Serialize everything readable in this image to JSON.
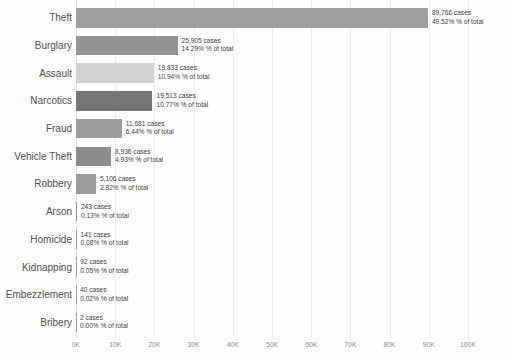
{
  "chart_data": {
    "type": "bar",
    "orientation": "horizontal",
    "title": "",
    "xlabel": "",
    "ylabel": "",
    "categories": [
      "Theft",
      "Burglary",
      "Assault",
      "Narcotics",
      "Fraud",
      "Vehicle Theft",
      "Robbery",
      "Arson",
      "Homicide",
      "Kidnapping",
      "Embezzlement",
      "Bribery"
    ],
    "values": [
      89766,
      25905,
      19833,
      19513,
      11681,
      8936,
      5106,
      243,
      141,
      92,
      40,
      2
    ],
    "pct_of_total": [
      49.52,
      14.29,
      10.94,
      10.77,
      6.44,
      4.93,
      2.82,
      0.13,
      0.08,
      0.05,
      0.02,
      0.0
    ],
    "bar_labels_line1": [
      "89,766 cases",
      "25,905 cases",
      "19,833 cases",
      "11,681 cases",
      "8,936 cases",
      "5,106 cases",
      "243 cases",
      "141 cases",
      "92 cases",
      "40 cases",
      "2 cases",
      "19,513 cases"
    ],
    "bar_label_cases": [
      "89,766 cases",
      "25,905 cases",
      "19,833 cases",
      "19,513 cases",
      "11,681 cases",
      "8,936 cases",
      "5,106 cases",
      "243 cases",
      "141 cases",
      "92 cases",
      "40 cases",
      "2 cases"
    ],
    "bar_label_pct": [
      "49.52% % of total",
      "14.29% % of total",
      "10.94% % of total",
      "10.77% % of total",
      "6.44% % of total",
      "4.93% % of total",
      "2.82% % of total",
      "0.13% % of total",
      "0.08% % of total",
      "0.05% % of total",
      "0.02% % of total",
      "0.00% % of total"
    ],
    "bar_colors": [
      "#9e9e9e",
      "#929292",
      "#d2d2d2",
      "#757575",
      "#9c9c9c",
      "#8c8c8c",
      "#9b9b9b",
      "#8f8f8f",
      "#9e9e9e",
      "#9e9e9e",
      "#9e9e9e",
      "#9e9e9e"
    ],
    "x_ticks": [
      "0K",
      "10K",
      "20K",
      "30K",
      "40K",
      "50K",
      "60K",
      "70K",
      "80K",
      "90K",
      "100K"
    ],
    "x_tick_values": [
      0,
      10000,
      20000,
      30000,
      40000,
      50000,
      60000,
      70000,
      80000,
      90000,
      100000
    ],
    "xlim": [
      0,
      100000
    ],
    "grid": "vertical light-gray gridlines at each 10K",
    "legend": "none"
  },
  "colors": {
    "background": "#fdfdfd",
    "gridline": "#ededed",
    "category_text": "#4f4f4f",
    "value_text": "#3d3d3d",
    "axis_text": "#8d8d8d"
  }
}
